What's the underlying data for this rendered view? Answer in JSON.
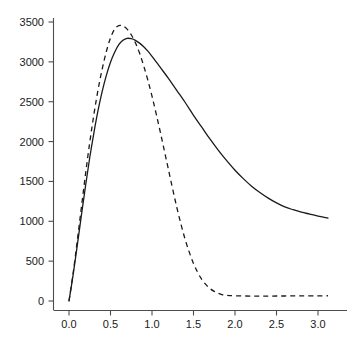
{
  "chart_data": {
    "type": "line",
    "title": "",
    "subtitle": "",
    "xlabel": "",
    "ylabel": "",
    "xlim": [
      -0.18,
      3.32
    ],
    "ylim": [
      -110,
      3620
    ],
    "grid": false,
    "legend": null,
    "legend_position": "none",
    "annotations": [],
    "xticks": [
      0.0,
      0.5,
      1.0,
      1.5,
      2.0,
      2.5,
      3.0
    ],
    "xtick_labels": [
      "0.0",
      "0.5",
      "1.0",
      "1.5",
      "2.0",
      "2.5",
      "3.0"
    ],
    "yticks": [
      0,
      500,
      1000,
      1500,
      2000,
      2500,
      3000,
      3500
    ],
    "ytick_labels": [
      "0",
      "500",
      "1000",
      "1500",
      "2000",
      "2500",
      "3000",
      "3500"
    ],
    "series": [
      {
        "name": "solid-curve",
        "style": "solid",
        "color": "#1a1a1a",
        "peak": {
          "x": 0.63,
          "y": 3300
        },
        "x": [
          0.0,
          0.05,
          0.1,
          0.15,
          0.2,
          0.25,
          0.3,
          0.35,
          0.4,
          0.45,
          0.5,
          0.55,
          0.6,
          0.65,
          0.7,
          0.75,
          0.8,
          0.85,
          0.9,
          0.95,
          1.0,
          1.1,
          1.2,
          1.3,
          1.4,
          1.5,
          1.6,
          1.7,
          1.8,
          1.9,
          2.0,
          2.1,
          2.2,
          2.3,
          2.4,
          2.5,
          2.6,
          2.7,
          2.8,
          2.9,
          3.0,
          3.12
        ],
        "y": [
          0,
          330,
          700,
          1080,
          1450,
          1800,
          2110,
          2390,
          2630,
          2830,
          2995,
          3120,
          3215,
          3270,
          3295,
          3290,
          3270,
          3235,
          3190,
          3135,
          3070,
          2930,
          2790,
          2640,
          2490,
          2330,
          2180,
          2030,
          1890,
          1760,
          1640,
          1535,
          1440,
          1360,
          1290,
          1230,
          1180,
          1145,
          1115,
          1090,
          1065,
          1040
        ]
      },
      {
        "name": "dashed-curve",
        "style": "dashed",
        "color": "#1a1a1a",
        "peak": {
          "x": 0.53,
          "y": 3460
        },
        "plateau_level": 65,
        "x": [
          0.0,
          0.05,
          0.1,
          0.15,
          0.2,
          0.25,
          0.3,
          0.35,
          0.4,
          0.45,
          0.5,
          0.55,
          0.6,
          0.65,
          0.7,
          0.75,
          0.8,
          0.85,
          0.9,
          0.95,
          1.0,
          1.05,
          1.1,
          1.15,
          1.2,
          1.25,
          1.3,
          1.35,
          1.4,
          1.45,
          1.5,
          1.55,
          1.6,
          1.65,
          1.7,
          1.75,
          1.8,
          1.85,
          1.9,
          2.0,
          2.2,
          2.4,
          2.6,
          2.8,
          3.0,
          3.12
        ],
        "y": [
          0,
          350,
          760,
          1180,
          1600,
          1990,
          2340,
          2650,
          2910,
          3130,
          3300,
          3410,
          3455,
          3450,
          3410,
          3340,
          3240,
          3110,
          2950,
          2770,
          2570,
          2350,
          2120,
          1880,
          1640,
          1400,
          1170,
          960,
          770,
          610,
          470,
          360,
          270,
          205,
          155,
          120,
          95,
          78,
          70,
          65,
          62,
          62,
          63,
          64,
          65,
          66
        ]
      }
    ]
  },
  "axes": {
    "y_axis_name": "y-axis",
    "x_axis_name": "x-axis"
  }
}
